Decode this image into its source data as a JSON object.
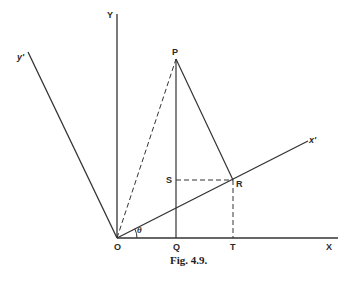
{
  "figure": {
    "caption": "Fig. 4.9.",
    "colors": {
      "line": "#333333",
      "text": "#2a2a2a",
      "background": "#ffffff"
    }
  },
  "axes": {
    "x_label": "X",
    "y_label": "Y",
    "x_prime_label": "x'",
    "y_prime_label": "y'"
  },
  "points": {
    "origin": "O",
    "p": "P",
    "q": "Q",
    "r": "R",
    "s": "S",
    "t": "T"
  },
  "angle": {
    "label": "θ"
  }
}
